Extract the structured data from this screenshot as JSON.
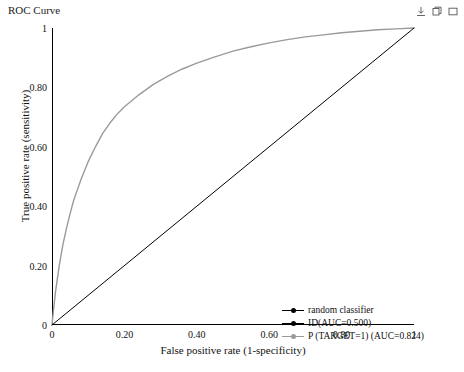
{
  "title": "ROC Curve",
  "toolbar": {
    "icons": [
      {
        "name": "download-icon",
        "glyph": "⤓"
      },
      {
        "name": "copy-icon",
        "glyph": "⎇"
      },
      {
        "name": "maximize-icon",
        "glyph": "▭"
      }
    ]
  },
  "chart_data": {
    "type": "line",
    "title": "ROC Curve",
    "xlabel": "False positive rate (1-specificity)",
    "ylabel": "True positive rate (sensitivity)",
    "xlim": [
      0,
      1
    ],
    "ylim": [
      0,
      1
    ],
    "grid": false,
    "xticks": [
      "0",
      "0.20",
      "0.40",
      "0.60",
      "0.80",
      "1"
    ],
    "xtick_values": [
      0,
      0.2,
      0.4,
      0.6,
      0.8,
      1
    ],
    "yticks": [
      "0",
      "0.20",
      "0.40",
      "0.60",
      "0.80",
      "1"
    ],
    "ytick_values": [
      0,
      0.2,
      0.4,
      0.6,
      0.8,
      1
    ],
    "legend_position": "bottom-right",
    "series": [
      {
        "name": "random classifier",
        "color": "#000000",
        "auc": 0.5,
        "x": [
          0,
          1
        ],
        "y": [
          0,
          1
        ]
      },
      {
        "name": "ID(AUC=0.500)",
        "color": "#000000",
        "auc": 0.5,
        "x": [
          0,
          1
        ],
        "y": [
          0,
          1
        ]
      },
      {
        "name": "P (TARGET=1) (AUC=0.824)",
        "color": "#9a9a9a",
        "auc": 0.824,
        "x": [
          0,
          0.005,
          0.01,
          0.02,
          0.03,
          0.04,
          0.05,
          0.06,
          0.07,
          0.08,
          0.09,
          0.1,
          0.12,
          0.14,
          0.16,
          0.18,
          0.2,
          0.24,
          0.28,
          0.32,
          0.36,
          0.4,
          0.45,
          0.5,
          0.55,
          0.6,
          0.65,
          0.7,
          0.75,
          0.8,
          0.85,
          0.9,
          0.95,
          1.0
        ],
        "y": [
          0,
          0.06,
          0.115,
          0.2,
          0.27,
          0.325,
          0.375,
          0.42,
          0.455,
          0.49,
          0.52,
          0.55,
          0.6,
          0.645,
          0.68,
          0.71,
          0.735,
          0.775,
          0.81,
          0.838,
          0.862,
          0.882,
          0.903,
          0.922,
          0.937,
          0.95,
          0.961,
          0.97,
          0.977,
          0.984,
          0.989,
          0.994,
          0.997,
          1.0
        ]
      }
    ]
  },
  "legend": {
    "items": [
      {
        "label": "random classifier",
        "color": "#000000"
      },
      {
        "label": "ID(AUC=0.500)",
        "color": "#000000"
      },
      {
        "label": "P (TARGET=1) (AUC=0.824)",
        "color": "#9a9a9a"
      }
    ]
  }
}
